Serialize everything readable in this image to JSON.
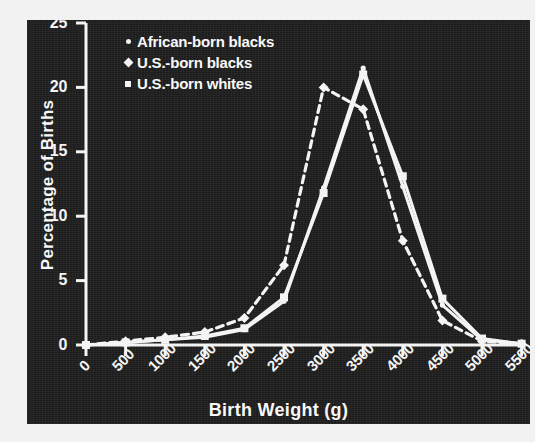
{
  "figure": {
    "background_color": "#f2f2f2",
    "panel_color": "#1c1c1c",
    "ink_color": "#f4f4f4"
  },
  "legend": {
    "position": "top-left-inside",
    "entries": [
      {
        "label": "African-born blacks",
        "marker": "dot-icon",
        "line": "solid"
      },
      {
        "label": "U.S.-born blacks",
        "marker": "diamond-icon",
        "line": "dashed"
      },
      {
        "label": "U.S.-born whites",
        "marker": "square-icon",
        "line": "solid"
      }
    ]
  },
  "chart_data": {
    "type": "line",
    "title": "",
    "subtitle": "",
    "xlabel": "Birth Weight (g)",
    "ylabel": "Percentage of Births",
    "xlim": [
      0,
      5500
    ],
    "ylim": [
      0,
      25
    ],
    "grid": false,
    "legend_position": "upper left",
    "x_ticks": [
      0,
      500,
      1000,
      1500,
      2000,
      2500,
      3000,
      3500,
      4000,
      4500,
      5000,
      5500
    ],
    "x_tick_labels": [
      "0",
      "500",
      "1000",
      "1500",
      "2000",
      "2500",
      "3000",
      "3500",
      "4000",
      "4500",
      "5000",
      "5500"
    ],
    "y_ticks": [
      0,
      5,
      10,
      15,
      20,
      25
    ],
    "y_tick_labels": [
      "0",
      "5",
      "10",
      "15",
      "20",
      "25"
    ],
    "x": [
      0,
      500,
      1000,
      1500,
      2000,
      2500,
      3000,
      3500,
      4000,
      4500,
      5000,
      5500
    ],
    "series": [
      {
        "name": "African-born blacks",
        "marker": "dot",
        "linestyle": "solid",
        "color": "#f4f4f4",
        "values": [
          0.0,
          0.2,
          0.4,
          0.6,
          1.2,
          3.4,
          12.2,
          21.5,
          12.3,
          3.1,
          0.4,
          0.1
        ]
      },
      {
        "name": "U.S.-born blacks",
        "marker": "diamond",
        "linestyle": "dashed",
        "color": "#f4f4f4",
        "values": [
          0.0,
          0.3,
          0.6,
          1.0,
          2.1,
          6.2,
          20.0,
          18.3,
          8.1,
          1.9,
          0.3,
          0.1
        ]
      },
      {
        "name": "U.S.-born whites",
        "marker": "square",
        "linestyle": "solid",
        "color": "#f4f4f4",
        "values": [
          0.0,
          0.2,
          0.4,
          0.7,
          1.3,
          3.7,
          11.8,
          21.0,
          13.1,
          3.6,
          0.5,
          0.1
        ]
      }
    ]
  }
}
